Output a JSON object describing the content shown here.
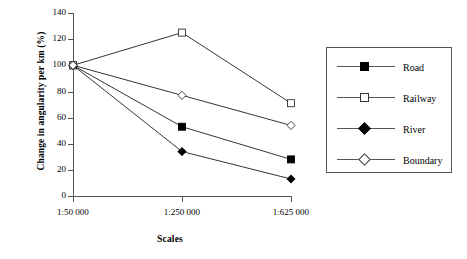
{
  "chart_data": {
    "type": "line",
    "title": "",
    "xlabel": "Scales",
    "ylabel": "Change in angularity per km (%)",
    "categories": [
      "1:50 000",
      "1:250 000",
      "1:625 000"
    ],
    "ylim": [
      0,
      140
    ],
    "yticks": [
      0,
      20,
      40,
      60,
      80,
      100,
      120,
      140
    ],
    "ytick_labels": [
      "0",
      "20",
      "40",
      "60",
      "80",
      "100",
      "120",
      "140"
    ],
    "grid": false,
    "legend_position": "right-outside",
    "series": [
      {
        "name": "Road",
        "marker": "square-filled",
        "color": "#000000",
        "values": [
          100,
          53,
          28
        ]
      },
      {
        "name": "Railway",
        "marker": "square-open",
        "color": "#000000",
        "values": [
          100,
          125,
          71
        ]
      },
      {
        "name": "River",
        "marker": "diamond-filled",
        "color": "#000000",
        "values": [
          100,
          34,
          13
        ]
      },
      {
        "name": "Boundary",
        "marker": "diamond-open",
        "color": "#000000",
        "values": [
          100,
          77,
          54
        ]
      }
    ]
  },
  "axes": {
    "x_title": "Scales",
    "y_title": "Change in angularity per km (%)",
    "x_labels": [
      "1:50 000",
      "1:250 000",
      "1:625 000"
    ],
    "y_labels": [
      "140",
      "120",
      "100",
      "80",
      "60",
      "40",
      "20",
      "0"
    ]
  },
  "legend": {
    "items": [
      {
        "label": "Road",
        "marker": "square-filled"
      },
      {
        "label": "Railway",
        "marker": "square-open"
      },
      {
        "label": "River",
        "marker": "diamond-filled"
      },
      {
        "label": "Boundary",
        "marker": "diamond-open"
      }
    ]
  }
}
